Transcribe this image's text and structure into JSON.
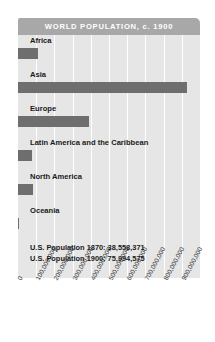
{
  "title": "WORLD POPULATION, c. 1900",
  "colors": {
    "banner": "#a8a8a8",
    "plot_background": "#e6e6e6",
    "gridline": "#ffffff",
    "bar": "#6e6e6e",
    "text": "#1a1a1a",
    "banner_text": "#ffffff"
  },
  "footnotes": [
    "U.S. Population 1870: 38,558,371",
    "U.S. Population 1900: 75,994,575"
  ],
  "chart_data": {
    "type": "bar",
    "orientation": "horizontal",
    "title": "WORLD POPULATION, c. 1900",
    "xlabel": "",
    "ylabel": "",
    "xlim": [
      0,
      1000000000
    ],
    "grid": true,
    "legend": false,
    "categories": [
      "Africa",
      "Asia",
      "Europe",
      "Latin America and the Caribbean",
      "North America",
      "Oceania"
    ],
    "values": [
      110000000,
      930000000,
      390000000,
      75000000,
      82000000,
      6000000
    ],
    "tick_labels": [
      "0",
      "100,000,000",
      "200,000,000",
      "300,000,000",
      "400,000,000",
      "500,000,000",
      "600,000,000",
      "700,000,000",
      "800,000,000",
      "900,000,000"
    ],
    "tick_values": [
      0,
      100000000,
      200000000,
      300000000,
      400000000,
      500000000,
      600000000,
      700000000,
      800000000,
      900000000
    ],
    "annotations": [
      "U.S. Population 1870: 38,558,371",
      "U.S. Population 1900: 75,994,575"
    ]
  }
}
